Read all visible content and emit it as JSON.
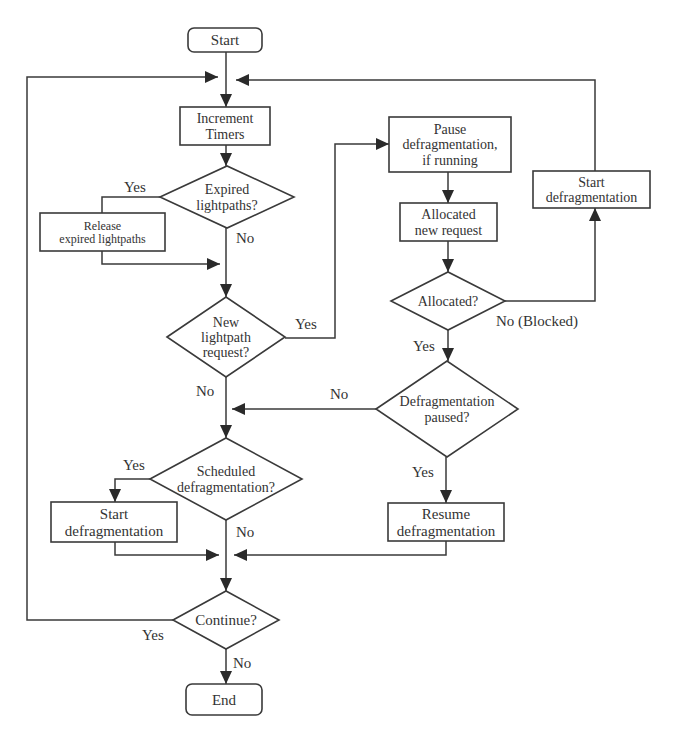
{
  "diagram": {
    "type": "flowchart",
    "nodes": [
      {
        "id": "start",
        "shape": "terminal",
        "lines": [
          "Start"
        ],
        "x": 188,
        "y": 28,
        "w": 74,
        "h": 24,
        "fs": 15
      },
      {
        "id": "increment_timers",
        "shape": "process",
        "lines": [
          "Increment",
          "Timers"
        ],
        "x": 180,
        "y": 107,
        "w": 90,
        "h": 38,
        "fs": 14
      },
      {
        "id": "expired_lightpaths",
        "shape": "decision",
        "lines": [
          "Expired",
          "lightpaths?"
        ],
        "cx": 227,
        "cy": 197,
        "hw": 67,
        "hh": 31,
        "fs": 14
      },
      {
        "id": "release_expired",
        "shape": "process",
        "lines": [
          "Release",
          "expired lightpaths"
        ],
        "x": 40,
        "y": 213,
        "w": 125,
        "h": 38,
        "fs": 12
      },
      {
        "id": "new_lightpath_request",
        "shape": "decision",
        "lines": [
          "New",
          "lightpath",
          "request?"
        ],
        "cx": 226,
        "cy": 337,
        "hw": 59,
        "hh": 40,
        "fs": 14
      },
      {
        "id": "pause_defrag",
        "shape": "process",
        "lines": [
          "Pause",
          "defragmentation,",
          "if running"
        ],
        "x": 389,
        "y": 117,
        "w": 122,
        "h": 55,
        "fs": 14
      },
      {
        "id": "allocated_new_request",
        "shape": "process",
        "lines": [
          "Allocated",
          "new request"
        ],
        "x": 400,
        "y": 203,
        "w": 97,
        "h": 38,
        "fs": 14
      },
      {
        "id": "start_defrag_right",
        "shape": "process",
        "lines": [
          "Start",
          "defragmentation"
        ],
        "x": 533,
        "y": 171,
        "w": 117,
        "h": 37,
        "fs": 14
      },
      {
        "id": "allocated_q",
        "shape": "decision",
        "lines": [
          "Allocated?"
        ],
        "cx": 448,
        "cy": 301,
        "hw": 57,
        "hh": 29,
        "fs": 14
      },
      {
        "id": "defrag_paused_q",
        "shape": "decision",
        "lines": [
          "Defragmentation",
          "paused?"
        ],
        "cx": 447,
        "cy": 409,
        "hw": 71,
        "hh": 48,
        "fs": 14
      },
      {
        "id": "scheduled_defrag_q",
        "shape": "decision",
        "lines": [
          "Scheduled",
          "defragmentation?"
        ],
        "cx": 226,
        "cy": 479,
        "hw": 76,
        "hh": 41,
        "fs": 14
      },
      {
        "id": "start_defrag_left",
        "shape": "process",
        "lines": [
          "Start",
          "defragmentation"
        ],
        "x": 51,
        "y": 502,
        "w": 126,
        "h": 40,
        "fs": 15
      },
      {
        "id": "resume_defrag",
        "shape": "process",
        "lines": [
          "Resume",
          "defragmentation"
        ],
        "x": 388,
        "y": 503,
        "w": 116,
        "h": 38,
        "fs": 15
      },
      {
        "id": "continue_q",
        "shape": "decision",
        "lines": [
          "Continue?"
        ],
        "cx": 226,
        "cy": 620,
        "hw": 53,
        "hh": 29,
        "fs": 15
      },
      {
        "id": "end",
        "shape": "terminal",
        "lines": [
          "End"
        ],
        "x": 186,
        "y": 684,
        "w": 76,
        "h": 31,
        "fs": 15
      }
    ],
    "edges": [
      {
        "from": "start",
        "to": "increment_timers",
        "points": [
          [
            226,
            52
          ],
          [
            226,
            107
          ]
        ],
        "arrow": true
      },
      {
        "from": "continue_q",
        "to": "increment_timers",
        "label": "Yes",
        "points": [
          [
            173,
            620
          ],
          [
            27,
            620
          ],
          [
            27,
            77
          ],
          [
            218,
            77
          ]
        ],
        "arrow": true
      },
      {
        "from": "start_defrag_right",
        "to": "increment_timers",
        "points": [
          [
            595,
            171
          ],
          [
            595,
            80
          ],
          [
            236,
            80
          ]
        ],
        "arrow": true
      },
      {
        "from": "increment_timers",
        "to": "expired_lightpaths",
        "points": [
          [
            226,
            145
          ],
          [
            226,
            166
          ]
        ],
        "arrow": true
      },
      {
        "from": "expired_lightpaths",
        "to": "release_expired",
        "label": "Yes",
        "points": [
          [
            160,
            197
          ],
          [
            102,
            197
          ],
          [
            102,
            213
          ]
        ],
        "arrow": false
      },
      {
        "from": "release_expired",
        "to": "merge1",
        "points": [
          [
            102,
            251
          ],
          [
            102,
            264
          ],
          [
            220,
            264
          ]
        ],
        "arrow": true
      },
      {
        "from": "expired_lightpaths",
        "to": "new_lightpath_request",
        "label": "No",
        "points": [
          [
            226,
            228
          ],
          [
            226,
            297
          ]
        ],
        "arrow": true
      },
      {
        "from": "new_lightpath_request",
        "to": "pause_defrag",
        "label": "Yes",
        "points": [
          [
            285,
            338
          ],
          [
            335,
            338
          ],
          [
            335,
            144
          ],
          [
            389,
            144
          ]
        ],
        "arrow": true
      },
      {
        "from": "pause_defrag",
        "to": "allocated_new_request",
        "points": [
          [
            448,
            172
          ],
          [
            448,
            203
          ]
        ],
        "arrow": true
      },
      {
        "from": "allocated_new_request",
        "to": "allocated_q",
        "points": [
          [
            448,
            241
          ],
          [
            448,
            272
          ]
        ],
        "arrow": true
      },
      {
        "from": "allocated_q",
        "to": "start_defrag_right",
        "label": "No (Blocked)",
        "points": [
          [
            505,
            301
          ],
          [
            595,
            301
          ],
          [
            595,
            208
          ]
        ],
        "arrow": true
      },
      {
        "from": "allocated_q",
        "to": "defrag_paused_q",
        "label": "Yes",
        "points": [
          [
            448,
            330
          ],
          [
            448,
            361
          ]
        ],
        "arrow": true
      },
      {
        "from": "defrag_paused_q",
        "to": "merge2",
        "label": "No",
        "points": [
          [
            376,
            409
          ],
          [
            232,
            409
          ]
        ],
        "arrow": true
      },
      {
        "from": "new_lightpath_request",
        "to": "scheduled_defrag_q",
        "label": "No",
        "points": [
          [
            226,
            377
          ],
          [
            226,
            438
          ]
        ],
        "arrow": true
      },
      {
        "from": "defrag_paused_q",
        "to": "resume_defrag",
        "label": "Yes",
        "points": [
          [
            446,
            457
          ],
          [
            446,
            503
          ]
        ],
        "arrow": true
      },
      {
        "from": "scheduled_defrag_q",
        "to": "start_defrag_left",
        "label": "Yes",
        "points": [
          [
            150,
            479
          ],
          [
            115,
            479
          ],
          [
            115,
            502
          ]
        ],
        "arrow": true
      },
      {
        "from": "start_defrag_left",
        "to": "merge3",
        "points": [
          [
            115,
            542
          ],
          [
            115,
            555
          ],
          [
            219,
            555
          ]
        ],
        "arrow": true
      },
      {
        "from": "resume_defrag",
        "to": "merge3",
        "points": [
          [
            446,
            541
          ],
          [
            446,
            555
          ],
          [
            234,
            555
          ]
        ],
        "arrow": true
      },
      {
        "from": "scheduled_defrag_q",
        "to": "continue_q",
        "label": "No",
        "points": [
          [
            226,
            520
          ],
          [
            226,
            591
          ]
        ],
        "arrow": true
      },
      {
        "from": "continue_q",
        "to": "end",
        "label": "No",
        "points": [
          [
            226,
            649
          ],
          [
            226,
            684
          ]
        ],
        "arrow": true
      }
    ],
    "labels": [
      {
        "text": "Yes",
        "x": 124,
        "y": 192
      },
      {
        "text": "No",
        "x": 236,
        "y": 243
      },
      {
        "text": "Yes",
        "x": 295,
        "y": 329
      },
      {
        "text": "No (Blocked)",
        "x": 496,
        "y": 326
      },
      {
        "text": "Yes",
        "x": 413,
        "y": 351
      },
      {
        "text": "No",
        "x": 196,
        "y": 396
      },
      {
        "text": "No",
        "x": 330,
        "y": 399
      },
      {
        "text": "Yes",
        "x": 123,
        "y": 470
      },
      {
        "text": "Yes",
        "x": 412,
        "y": 477
      },
      {
        "text": "No",
        "x": 236,
        "y": 537
      },
      {
        "text": "Yes",
        "x": 142,
        "y": 640
      },
      {
        "text": "No",
        "x": 233,
        "y": 668
      }
    ]
  }
}
